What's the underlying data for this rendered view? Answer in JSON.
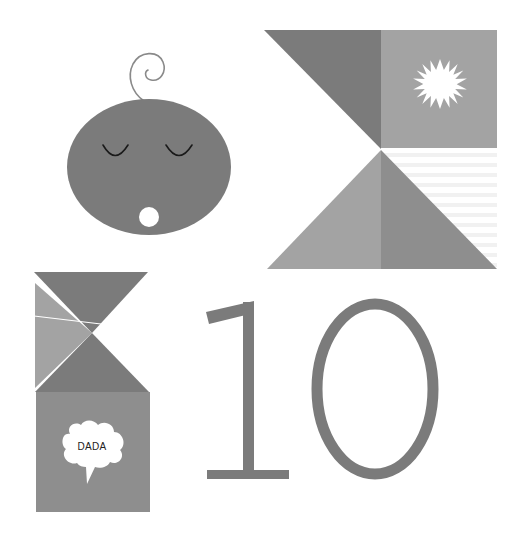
{
  "illustration": {
    "subject": "baby month 10 milestone card",
    "speech_bubble_text": "DADA",
    "number_text": "10",
    "colors": {
      "background": "#ffffff",
      "dark": "#7b7b7b",
      "medium": "#8e8e8e",
      "light": "#a3a3a3",
      "stripe": "#f1f1f1",
      "white": "#ffffff",
      "eye_line": "#1a1a1a"
    }
  }
}
